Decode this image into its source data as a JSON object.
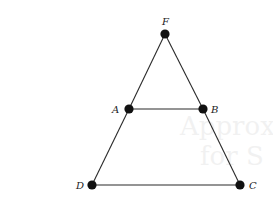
{
  "diagram": {
    "type": "geometry-figure",
    "points": [
      {
        "id": "F",
        "label": "F",
        "x": 165,
        "y": 34,
        "lx": 162,
        "ly": 25
      },
      {
        "id": "A",
        "label": "A",
        "x": 129,
        "y": 109,
        "lx": 112,
        "ly": 113
      },
      {
        "id": "B",
        "label": "B",
        "x": 203,
        "y": 109,
        "lx": 211,
        "ly": 113
      },
      {
        "id": "D",
        "label": "D",
        "x": 92,
        "y": 185,
        "lx": 76,
        "ly": 189
      },
      {
        "id": "C",
        "label": "C",
        "x": 240,
        "y": 185,
        "lx": 249,
        "ly": 189
      }
    ],
    "segments": [
      {
        "from": "F",
        "to": "A"
      },
      {
        "from": "A",
        "to": "D"
      },
      {
        "from": "F",
        "to": "B"
      },
      {
        "from": "B",
        "to": "C"
      },
      {
        "from": "A",
        "to": "B"
      },
      {
        "from": "D",
        "to": "C"
      }
    ],
    "colors": {
      "line": "#2a2a2a",
      "vertex": "#111111",
      "label": "#222222"
    }
  }
}
